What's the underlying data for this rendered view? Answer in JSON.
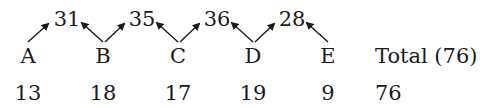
{
  "diagram": {
    "nodes": [
      {
        "label": "A",
        "value": "13"
      },
      {
        "label": "B",
        "value": "18"
      },
      {
        "label": "C",
        "value": "17"
      },
      {
        "label": "D",
        "value": "19"
      },
      {
        "label": "E",
        "value": "9"
      }
    ],
    "pair_sums": [
      "31",
      "35",
      "36",
      "28"
    ],
    "total_label": "Total (76)",
    "total_value": "76",
    "colors": {
      "text": "#1a1a1a",
      "background": "#ffffff"
    }
  }
}
